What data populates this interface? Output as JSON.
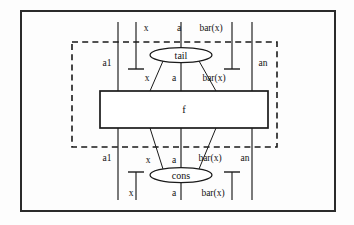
{
  "figure": {
    "background_color": "#fdfdfd",
    "ink_color": "#1a1a1a",
    "frame": {
      "x": 21,
      "y": 11,
      "width": 314,
      "height": 200
    },
    "dashed_box": {
      "x": 72,
      "y": 42,
      "width": 205,
      "height": 105
    }
  },
  "nodes": {
    "tail": {
      "label": "tail",
      "cx": 181,
      "cy": 55,
      "rx": 31,
      "ry": 7.5
    },
    "cons": {
      "label": "cons",
      "cx": 181,
      "cy": 175,
      "rx": 31,
      "ry": 7.5
    },
    "fbox": {
      "label": "f",
      "x": 100,
      "y": 91,
      "width": 168,
      "height": 37
    }
  },
  "wires": {
    "a1": {
      "x": 118,
      "label": "a1"
    },
    "x": {
      "x": 136,
      "label": "x"
    },
    "a": {
      "x": 181,
      "label": "a"
    },
    "barx": {
      "x": 232,
      "label": "bar(x)"
    },
    "an": {
      "x": 252,
      "label": "an"
    }
  },
  "labels": {
    "top_row": [
      "x",
      "a",
      "bar(x)"
    ],
    "upper_mid_left": "a1",
    "upper_mid_right": "an",
    "under_tail_row": [
      "x",
      "a",
      "bar(x)"
    ],
    "f_label": "f",
    "over_cons_row": [
      "x",
      "a",
      "bar(x)"
    ],
    "lower_mid_left": "a1",
    "lower_mid_right": "an",
    "bottom_row": [
      "x",
      "a",
      "bar(x)"
    ]
  },
  "text_items": [
    {
      "name": "label-top-x",
      "text": "x",
      "x": 146,
      "y": 31,
      "anchor": "middle"
    },
    {
      "name": "label-top-a",
      "text": "a",
      "x": 179,
      "y": 31,
      "anchor": "middle"
    },
    {
      "name": "label-top-barx",
      "text": "bar(x)",
      "x": 211,
      "y": 31,
      "anchor": "middle"
    },
    {
      "name": "label-upper-a1",
      "text": "a1",
      "x": 107,
      "y": 66,
      "anchor": "middle"
    },
    {
      "name": "label-upper-an",
      "text": "an",
      "x": 263,
      "y": 66,
      "anchor": "middle"
    },
    {
      "name": "label-tail-out-x",
      "text": "x",
      "x": 147,
      "y": 81,
      "anchor": "middle"
    },
    {
      "name": "label-tail-out-a",
      "text": "a",
      "x": 174,
      "y": 81,
      "anchor": "middle"
    },
    {
      "name": "label-tail-out-barx",
      "text": "bar(x)",
      "x": 214,
      "y": 81,
      "anchor": "middle"
    },
    {
      "name": "label-f",
      "text": "f",
      "x": 184,
      "y": 113,
      "anchor": "middle"
    },
    {
      "name": "label-cons-in-x",
      "text": "x",
      "x": 148,
      "y": 163,
      "anchor": "middle"
    },
    {
      "name": "label-cons-in-a",
      "text": "a",
      "x": 174,
      "y": 163,
      "anchor": "middle"
    },
    {
      "name": "label-cons-in-barx",
      "text": "bar(x)",
      "x": 210,
      "y": 161,
      "anchor": "middle"
    },
    {
      "name": "label-lower-a1",
      "text": "a1",
      "x": 107,
      "y": 161,
      "anchor": "middle"
    },
    {
      "name": "label-lower-an",
      "text": "an",
      "x": 245,
      "y": 161,
      "anchor": "middle"
    },
    {
      "name": "label-bottom-x",
      "text": "x",
      "x": 131,
      "y": 196,
      "anchor": "middle"
    },
    {
      "name": "label-bottom-a",
      "text": "a",
      "x": 174,
      "y": 196,
      "anchor": "middle"
    },
    {
      "name": "label-bottom-barx",
      "text": "bar(x)",
      "x": 213,
      "y": 196,
      "anchor": "middle"
    }
  ],
  "segments": [
    {
      "name": "wire-a1-top",
      "x1": 118,
      "y1": 22,
      "x2": 118,
      "y2": 91
    },
    {
      "name": "wire-a1-bottom",
      "x1": 118,
      "y1": 128,
      "x2": 118,
      "y2": 200
    },
    {
      "name": "wire-an-top",
      "x1": 252,
      "y1": 22,
      "x2": 252,
      "y2": 91
    },
    {
      "name": "wire-an-bottom",
      "x1": 252,
      "y1": 128,
      "x2": 252,
      "y2": 200
    },
    {
      "name": "wire-a-top",
      "x1": 181,
      "y1": 22,
      "x2": 181,
      "y2": 48
    },
    {
      "name": "wire-a-mid-upper",
      "x1": 181,
      "y1": 62,
      "x2": 181,
      "y2": 91
    },
    {
      "name": "wire-a-mid-lower",
      "x1": 181,
      "y1": 128,
      "x2": 181,
      "y2": 168
    },
    {
      "name": "wire-a-bottom",
      "x1": 181,
      "y1": 182,
      "x2": 181,
      "y2": 200
    },
    {
      "name": "wire-x-cap-top",
      "x1": 136,
      "y1": 22,
      "x2": 136,
      "y2": 69
    },
    {
      "name": "wire-barx-cap-top",
      "x1": 232,
      "y1": 22,
      "x2": 232,
      "y2": 69
    },
    {
      "name": "wire-x-cap-bot",
      "x1": 136,
      "y1": 172,
      "x2": 136,
      "y2": 200
    },
    {
      "name": "wire-barx-cap-bot",
      "x1": 232,
      "y1": 172,
      "x2": 232,
      "y2": 200
    },
    {
      "name": "leg-tail-left",
      "x1": 163,
      "y1": 61,
      "x2": 150,
      "y2": 91
    },
    {
      "name": "leg-tail-right",
      "x1": 199,
      "y1": 61,
      "x2": 216,
      "y2": 91
    },
    {
      "name": "leg-cons-left",
      "x1": 163,
      "y1": 169,
      "x2": 150,
      "y2": 128
    },
    {
      "name": "leg-cons-right",
      "x1": 199,
      "y1": 169,
      "x2": 216,
      "y2": 128
    }
  ],
  "caps": [
    {
      "name": "cap-x-top",
      "x": 136,
      "y": 69,
      "half_width": 8,
      "orientation": "down"
    },
    {
      "name": "cap-barx-top",
      "x": 232,
      "y": 69,
      "half_width": 8,
      "orientation": "down"
    },
    {
      "name": "cap-x-bottom",
      "x": 136,
      "y": 172,
      "half_width": 8,
      "orientation": "up"
    },
    {
      "name": "cap-barx-bot",
      "x": 232,
      "y": 172,
      "half_width": 8,
      "orientation": "up"
    }
  ]
}
